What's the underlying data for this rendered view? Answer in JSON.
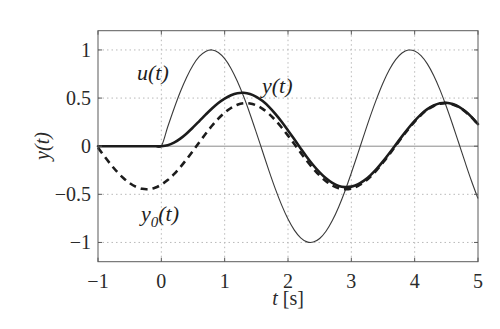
{
  "chart_data": {
    "type": "line",
    "title": "",
    "xlabel": "t [s]",
    "xlabel_parts": {
      "var": "t",
      "unit": " [s]"
    },
    "ylabel": "y(t)",
    "xlim": [
      -1,
      5
    ],
    "ylim": [
      -1.2,
      1.2
    ],
    "xticks": [
      -1,
      0,
      1,
      2,
      3,
      4,
      5
    ],
    "xtick_labels": [
      "−1",
      "0",
      "1",
      "2",
      "3",
      "4",
      "5"
    ],
    "yticks": [
      1,
      0.5,
      0,
      -0.5,
      -1
    ],
    "ytick_labels": [
      "1",
      "0.5",
      "0",
      "−0.5",
      "−1"
    ],
    "grid": true,
    "legend": "none (inline curve annotations)",
    "annotations": [
      {
        "text": "u(t)",
        "series": "u(t)"
      },
      {
        "text": "y(t)",
        "series": "y(t)"
      },
      {
        "text": "y0(t)",
        "series": "y0(t)",
        "base": "y",
        "sub": "0",
        "tail": "(t)"
      }
    ],
    "x": [
      -1.0,
      -0.9,
      -0.8,
      -0.7,
      -0.6,
      -0.5,
      -0.4,
      -0.3,
      -0.2,
      -0.1,
      0.0,
      0.1,
      0.2,
      0.3,
      0.4,
      0.5,
      0.6,
      0.7,
      0.8,
      0.9,
      1.0,
      1.1,
      1.2,
      1.3,
      1.4,
      1.5,
      1.6,
      1.7,
      1.8,
      1.9,
      2.0,
      2.1,
      2.2,
      2.3,
      2.4,
      2.5,
      2.6,
      2.7,
      2.8,
      2.9,
      3.0,
      3.1,
      3.2,
      3.3,
      3.4,
      3.5,
      3.6,
      3.7,
      3.8,
      3.9,
      4.0,
      4.1,
      4.2,
      4.3,
      4.4,
      4.5,
      4.6,
      4.7,
      4.8,
      4.9,
      5.0
    ],
    "series": [
      {
        "name": "u(t)",
        "style": "thin solid",
        "values": [
          0,
          0,
          0,
          0,
          0,
          0,
          0,
          0,
          0,
          0,
          0.0,
          0.199,
          0.389,
          0.565,
          0.717,
          0.841,
          0.932,
          0.985,
          1.0,
          0.974,
          0.909,
          0.808,
          0.675,
          0.516,
          0.335,
          0.141,
          -0.058,
          -0.256,
          -0.443,
          -0.612,
          -0.757,
          -0.872,
          -0.952,
          -0.994,
          -0.996,
          -0.959,
          -0.884,
          -0.773,
          -0.631,
          -0.465,
          -0.279,
          -0.083,
          0.117,
          0.312,
          0.494,
          0.657,
          0.794,
          0.899,
          0.968,
          0.999,
          0.989,
          0.941,
          0.855,
          0.734,
          0.585,
          0.412,
          0.223,
          0.025,
          -0.174,
          -0.367,
          -0.544
        ]
      },
      {
        "name": "y(t)",
        "style": "thick solid",
        "values": [
          0,
          0,
          0,
          0,
          0,
          0,
          0,
          0,
          0,
          0,
          0.0,
          0.01,
          0.037,
          0.079,
          0.133,
          0.195,
          0.261,
          0.328,
          0.392,
          0.449,
          0.495,
          0.53,
          0.551,
          0.555,
          0.543,
          0.513,
          0.469,
          0.409,
          0.336,
          0.254,
          0.164,
          0.071,
          -0.023,
          -0.114,
          -0.198,
          -0.272,
          -0.334,
          -0.382,
          -0.413,
          -0.425,
          -0.42,
          -0.397,
          -0.358,
          -0.303,
          -0.236,
          -0.158,
          -0.074,
          0.014,
          0.102,
          0.186,
          0.263,
          0.331,
          0.385,
          0.423,
          0.446,
          0.451,
          0.438,
          0.409,
          0.362,
          0.302,
          0.23
        ]
      },
      {
        "name": "y0(t)",
        "style": "thick dashed",
        "values": [
          -0.015,
          -0.104,
          -0.188,
          -0.265,
          -0.331,
          -0.384,
          -0.422,
          -0.443,
          -0.446,
          -0.432,
          -0.4,
          -0.352,
          -0.291,
          -0.217,
          -0.135,
          -0.048,
          0.041,
          0.129,
          0.212,
          0.286,
          0.348,
          0.397,
          0.43,
          0.446,
          0.444,
          0.424,
          0.388,
          0.336,
          0.27,
          0.194,
          0.11,
          0.022,
          -0.067,
          -0.154,
          -0.234,
          -0.305,
          -0.364,
          -0.409,
          -0.437,
          -0.447,
          -0.44,
          -0.415,
          -0.374,
          -0.318,
          -0.249,
          -0.17,
          -0.085,
          0.004,
          0.093,
          0.178,
          0.256,
          0.324,
          0.379,
          0.418,
          0.441,
          0.447,
          0.434,
          0.405,
          0.359,
          0.299,
          0.227
        ]
      }
    ]
  },
  "labels": {
    "u": "u(t)",
    "y": "y(t)",
    "y0_base": "y",
    "y0_sub": "0",
    "y0_tail": "(t)",
    "ylabel": "y(t)",
    "xlabel_var": "t",
    "xlabel_unit": " [s]"
  },
  "colors": {
    "curves": "#1c1c1c",
    "grid": "#b9b9b9",
    "axes": "#5a5a5a"
  }
}
